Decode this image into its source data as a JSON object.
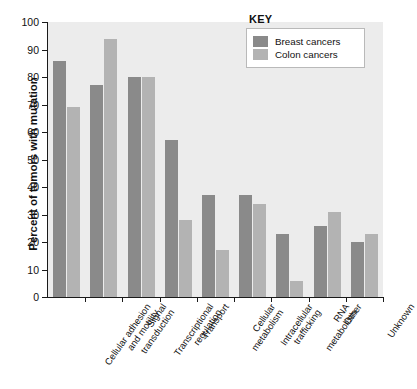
{
  "figure": {
    "ylabel": "Percent of tumors with mutation",
    "caption": ""
  },
  "legend": {
    "title": "KEY",
    "entries": [
      {
        "label": "Breast cancers",
        "color": "#8a8a8a"
      },
      {
        "label": "Colon cancers",
        "color": "#b3b3b3"
      }
    ]
  },
  "axis": {
    "yticks": [
      "0",
      "10",
      "20",
      "30",
      "40",
      "50",
      "60",
      "70",
      "80",
      "90",
      "100"
    ]
  },
  "chart_data": {
    "type": "bar",
    "title": "",
    "xlabel": "",
    "ylabel": "Percent of tumors with mutation",
    "ylim": [
      0,
      100
    ],
    "ytick_step": 10,
    "grid": false,
    "legend_position": "top-right",
    "categories": [
      "Cellular adhesion and motility",
      "Signal transduction",
      "Transcriptional regulation",
      "Transport",
      "Cellular metabolism",
      "Intracellular trafficking",
      "RNA metabolism",
      "Other",
      "Unknown"
    ],
    "category_lines": [
      [
        "Cellular adhesion",
        "and motility"
      ],
      [
        "Signal",
        "transduction"
      ],
      [
        "Transcriptional",
        "regulation"
      ],
      [
        "Transport"
      ],
      [
        "Cellular",
        "metabolism"
      ],
      [
        "Intracellular",
        "trafficking"
      ],
      [
        "RNA",
        "metabolism"
      ],
      [
        "Other"
      ],
      [
        "Unknown"
      ]
    ],
    "series": [
      {
        "name": "Breast cancers",
        "color": "#8a8a8a",
        "values": [
          86,
          77,
          80,
          57,
          37,
          37,
          23,
          26,
          20
        ]
      },
      {
        "name": "Colon cancers",
        "color": "#b3b3b3",
        "values": [
          69,
          94,
          80,
          28,
          17,
          34,
          6,
          31,
          23
        ]
      }
    ]
  }
}
